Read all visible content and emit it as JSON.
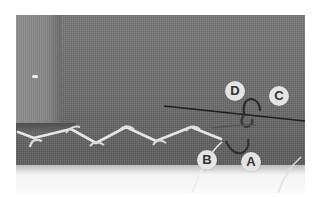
{
  "image": {
    "description": "Close-up photo of a catch (herringbone) hem stitch on gray fabric with a needle and thread, points labeled A-D",
    "labels": [
      {
        "id": "A",
        "text": "A"
      },
      {
        "id": "B",
        "text": "B"
      },
      {
        "id": "C",
        "text": "C"
      },
      {
        "id": "D",
        "text": "D"
      }
    ]
  },
  "colors": {
    "fabric": "#6f6f6f",
    "fold": "#8a8a8a",
    "thread": "#e8e8e8",
    "label_bg": "#e4e4e4",
    "label_text": "#333333"
  }
}
